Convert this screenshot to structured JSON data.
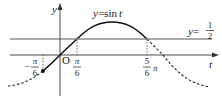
{
  "diagram": {
    "type": "function-graph",
    "function": "y = sin t",
    "curve_label_prefix": "y=",
    "curve_label_fn": "sin",
    "curve_label_var": "t",
    "hline_label_prefix": "y=",
    "hline_num": "1",
    "hline_den": "2",
    "axis_x_label": "t",
    "axis_y_label": "y",
    "origin_label": "O",
    "ticks": [
      {
        "id": "neg-pi-6",
        "sign": "−",
        "num": "π",
        "den": "6",
        "value": "-π/6"
      },
      {
        "id": "pi-6",
        "sign": "",
        "num": "π",
        "den": "6",
        "value": "π/6"
      },
      {
        "id": "5pi-6",
        "sign": "",
        "num": "5",
        "den": "6",
        "suffix": "π",
        "value": "5π/6"
      }
    ],
    "solid_range": "[-π/6, 5π/6]",
    "dashed_outside": true,
    "colors": {
      "ink": "#222222",
      "hline": "#555555",
      "background": "#ffffff"
    }
  }
}
